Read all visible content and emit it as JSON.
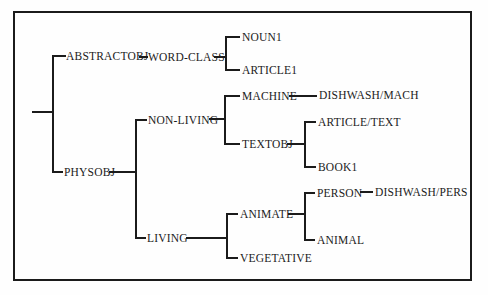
{
  "figure": {
    "type": "tree-diagram",
    "background_color": "#fefefe",
    "ink_color": "#1b1b1b",
    "border": "rectangular black frame"
  },
  "nodes": {
    "abstractobj": {
      "label": "ABSTRACTOBJ"
    },
    "word_class": {
      "label": "WORD-CLASS"
    },
    "noun1": {
      "label": "NOUN1"
    },
    "article1": {
      "label": "ARTICLE1"
    },
    "physobj": {
      "label": "PHYSOBJ"
    },
    "non_living": {
      "label": "NON-LIVING"
    },
    "machine": {
      "label": "MACHINE"
    },
    "dishwash_mach": {
      "label": "DISHWASH/MACH"
    },
    "textobj": {
      "label": "TEXTOBJ"
    },
    "article_text": {
      "label": "ARTICLE/TEXT"
    },
    "book1": {
      "label": "BOOK1"
    },
    "living": {
      "label": "LIVING"
    },
    "animate": {
      "label": "ANIMATE"
    },
    "person": {
      "label": "PERSON"
    },
    "dishwash_pers": {
      "label": "DISHWASH/PERS"
    },
    "animal": {
      "label": "ANIMAL"
    },
    "vegetative": {
      "label": "VEGETATIVE"
    }
  },
  "edges": [
    {
      "from": "root",
      "to": "ABSTRACTOBJ"
    },
    {
      "from": "root",
      "to": "PHYSOBJ"
    },
    {
      "from": "ABSTRACTOBJ",
      "to": "WORD-CLASS"
    },
    {
      "from": "WORD-CLASS",
      "to": "NOUN1"
    },
    {
      "from": "WORD-CLASS",
      "to": "ARTICLE1"
    },
    {
      "from": "PHYSOBJ",
      "to": "NON-LIVING"
    },
    {
      "from": "PHYSOBJ",
      "to": "LIVING"
    },
    {
      "from": "NON-LIVING",
      "to": "MACHINE"
    },
    {
      "from": "NON-LIVING",
      "to": "TEXTOBJ"
    },
    {
      "from": "MACHINE",
      "to": "DISHWASH/MACH"
    },
    {
      "from": "TEXTOBJ",
      "to": "ARTICLE/TEXT"
    },
    {
      "from": "TEXTOBJ",
      "to": "BOOK1"
    },
    {
      "from": "LIVING",
      "to": "ANIMATE"
    },
    {
      "from": "LIVING",
      "to": "VEGETATIVE"
    },
    {
      "from": "ANIMATE",
      "to": "PERSON"
    },
    {
      "from": "ANIMATE",
      "to": "ANIMAL"
    },
    {
      "from": "PERSON",
      "to": "DISHWASH/PERS"
    }
  ]
}
